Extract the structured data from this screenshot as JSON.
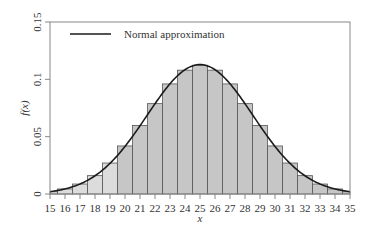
{
  "chart_data": {
    "type": "bar",
    "title": "",
    "xlabel": "x",
    "ylabel": "f(x)",
    "xlim": [
      15,
      35
    ],
    "ylim": [
      0,
      0.15
    ],
    "xticks": [
      15,
      16,
      17,
      18,
      19,
      20,
      21,
      22,
      23,
      24,
      25,
      26,
      27,
      28,
      29,
      30,
      31,
      32,
      33,
      34,
      35
    ],
    "yticks": [
      0,
      0.05,
      0.1,
      0.15
    ],
    "ytick_labels": [
      "0",
      "0.05",
      "0.1",
      "0.15"
    ],
    "grid": false,
    "legend": {
      "position": "upper left",
      "entries": [
        "Normal approximation"
      ]
    },
    "categories": [
      15,
      16,
      17,
      18,
      19,
      20,
      21,
      22,
      23,
      24,
      25,
      26,
      27,
      28,
      29,
      30,
      31,
      32,
      33,
      34,
      35
    ],
    "series": [
      {
        "name": "Binomial probability (histogram)",
        "type": "bar",
        "values": [
          0.002,
          0.0044,
          0.0087,
          0.016,
          0.027,
          0.0419,
          0.0598,
          0.0788,
          0.096,
          0.108,
          0.1123,
          0.108,
          0.096,
          0.0788,
          0.0598,
          0.0419,
          0.027,
          0.016,
          0.0087,
          0.0044,
          0.002
        ],
        "highlight_note": "bars for x <= 19 drawn in lighter shade"
      },
      {
        "name": "Normal approximation",
        "type": "line",
        "mean": 25,
        "sd": 3.5355
      }
    ],
    "colors": {
      "bar_light": "#dcdcdc",
      "bar_dark": "#c6c6c6",
      "bar_edge": "#555555",
      "curve": "#1a1a1a",
      "axis": "#888888"
    },
    "light_bar_max_x": 19
  }
}
